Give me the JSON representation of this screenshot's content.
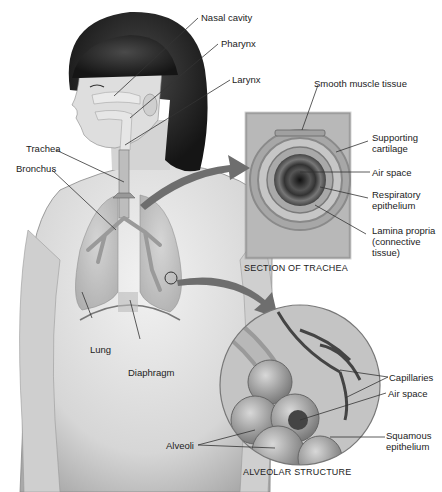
{
  "diagram": {
    "body_labels": {
      "nasal_cavity": "Nasal cavity",
      "pharynx": "Pharynx",
      "larynx": "Larynx",
      "trachea": "Trachea",
      "bronchus": "Bronchus",
      "lung": "Lung",
      "diaphragm": "Diaphragm"
    },
    "trachea_section": {
      "caption": "SECTION OF TRACHEA",
      "labels": {
        "smooth_muscle": "Smooth muscle tissue",
        "supporting_cartilage_1": "Supporting",
        "supporting_cartilage_2": "cartilage",
        "air_space": "Air space",
        "respiratory_epithelium_1": "Respiratory",
        "respiratory_epithelium_2": "epithelium",
        "lamina_propria_1": "Lamina propria",
        "lamina_propria_2": "(connective",
        "lamina_propria_3": "tissue)"
      }
    },
    "alveolar_structure": {
      "caption": "ALVEOLAR STRUCTURE",
      "labels": {
        "capillaries": "Capillaries",
        "air_space": "Air space",
        "squamous_epithelium_1": "Squamous",
        "squamous_epithelium_2": "epithelium",
        "alveoli": "Alveoli"
      }
    },
    "colors": {
      "skin": "#d9d9d9",
      "hair": "#2a2a2a",
      "panel": "#b5b5b5",
      "arrow": "#6e6e6e",
      "line": "#333333"
    }
  }
}
